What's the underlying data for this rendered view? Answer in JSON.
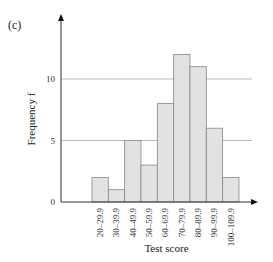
{
  "panel_label": "(c)",
  "chart_data": {
    "type": "bar",
    "title": "",
    "xlabel": "Test score",
    "ylabel": "Frequency f",
    "categories": [
      "20–29.9",
      "30–39.9",
      "40–49.9",
      "50–59.9",
      "60–69.9",
      "70–79.9",
      "80–89.9",
      "90–99.9",
      "100–109.9"
    ],
    "values": [
      2,
      1,
      5,
      3,
      8,
      12,
      11,
      6,
      2
    ],
    "ylim": [
      0,
      14
    ],
    "yticks": [
      0,
      5,
      10
    ],
    "grid": "horizontal at 5 and 10",
    "legend": null,
    "bar_color": "#e2e2e2",
    "bar_edge_color": "#888888",
    "grid_color": "#aaaaaa",
    "axis_color": "#333333"
  }
}
